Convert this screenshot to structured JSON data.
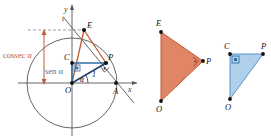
{
  "figure": {
    "colors": {
      "orange_fill": "#E08565",
      "orange_stroke": "#C15B33",
      "orange_text": "#BF5B33",
      "blue_fill": "#AFCFEA",
      "blue_stroke": "#2E6DA4",
      "blue_text": "#3C78B4",
      "axis": "#555555",
      "circle": "#555555",
      "point": "#111111"
    },
    "unit_circle": {
      "name": "unit-circle-diagram",
      "axis_labels": {
        "x": "x",
        "y": "y"
      },
      "tangent_line_label": "t",
      "points": [
        {
          "id": "O",
          "label": "O"
        },
        {
          "id": "A",
          "label": "A"
        },
        {
          "id": "C",
          "label": "C"
        },
        {
          "id": "P",
          "label": "P"
        },
        {
          "id": "E",
          "label": "E"
        }
      ],
      "annotations": {
        "cossec": "cossec α",
        "sen": "sen α",
        "angle": "α",
        "radius": "1"
      }
    },
    "triangle_orange": {
      "name": "triangle-OEP",
      "vertices": [
        {
          "id": "E",
          "label": "E"
        },
        {
          "id": "P",
          "label": "P"
        },
        {
          "id": "O",
          "label": "O"
        }
      ],
      "right_angle_at": "P"
    },
    "triangle_blue": {
      "name": "triangle-OCP",
      "vertices": [
        {
          "id": "C",
          "label": "C"
        },
        {
          "id": "P",
          "label": "P"
        },
        {
          "id": "O",
          "label": "O"
        }
      ],
      "right_angle_at": "C"
    }
  }
}
